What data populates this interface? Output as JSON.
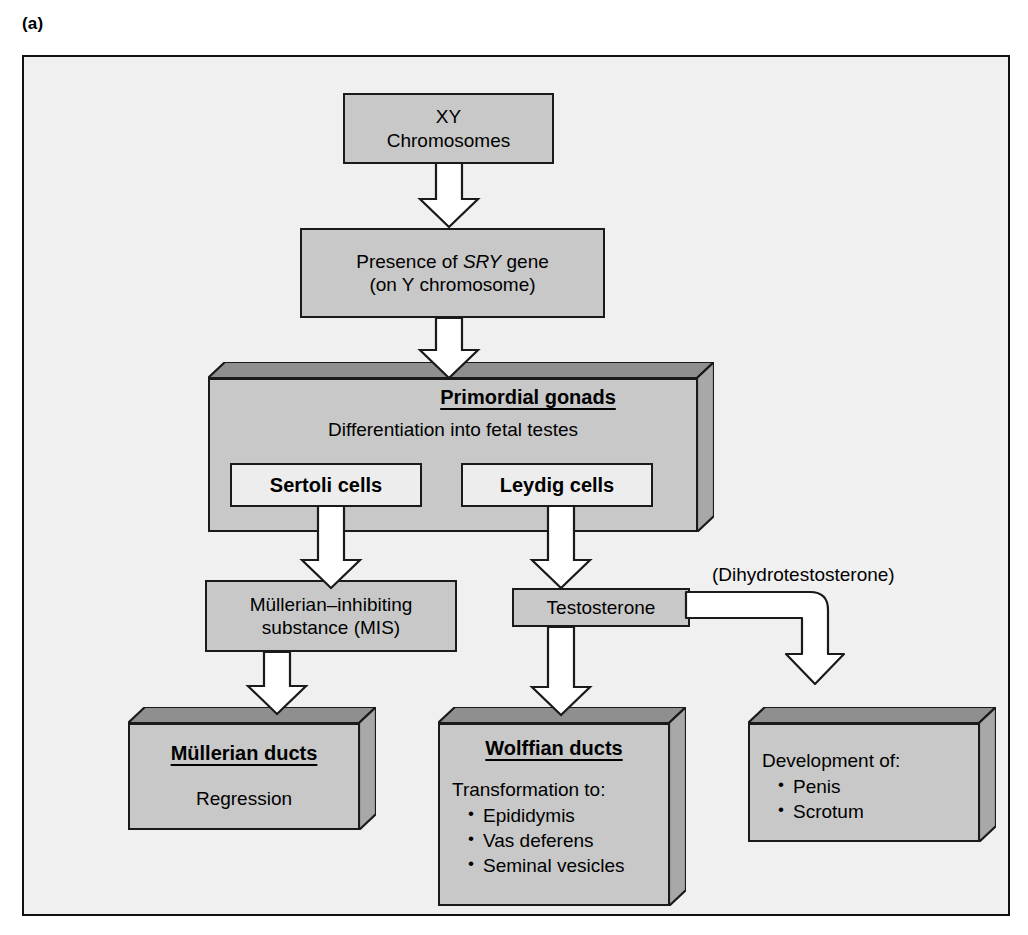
{
  "figure": {
    "panel_label": "(a)",
    "background_color": "#f0f0f0",
    "box_fill": "#c8c8c8",
    "box_fill_light": "#ededed",
    "outline_color": "#1a1a1a",
    "arrow_fill": "#ffffff"
  },
  "nodes": {
    "xy_chromosomes": {
      "line1": "XY",
      "line2": "Chromosomes"
    },
    "sry": {
      "prefix": "Presence of ",
      "gene": "SRY",
      "suffix": " gene",
      "line2": "(on Y chromosome)"
    },
    "gonads": {
      "title": "Primordial gonads",
      "subtitle": "Differentiation into fetal testes",
      "sertoli": "Sertoli cells",
      "leydig": "Leydig cells"
    },
    "mis": {
      "line1": "Müllerian–inhibiting",
      "line2": "substance (MIS)"
    },
    "testosterone": {
      "label": "Testosterone"
    },
    "dht": {
      "label": "(Dihydrotestosterone)"
    },
    "mullerian_ducts": {
      "title": "Müllerian ducts",
      "body": "Regression"
    },
    "wolffian_ducts": {
      "title": "Wolffian ducts",
      "body": "Transformation to:",
      "items": [
        "Epididymis",
        "Vas deferens",
        "Seminal vesicles"
      ]
    },
    "external_genitalia": {
      "body": "Development of:",
      "items": [
        "Penis",
        "Scrotum"
      ]
    }
  },
  "arrows": [
    {
      "name": "xy-to-sry",
      "from": "xy_chromosomes",
      "to": "sry",
      "style": "block-down"
    },
    {
      "name": "sry-to-gonads",
      "from": "sry",
      "to": "gonads",
      "style": "block-down"
    },
    {
      "name": "sertoli-to-mis",
      "from": "sertoli",
      "to": "mis",
      "style": "block-down"
    },
    {
      "name": "leydig-to-testosterone",
      "from": "leydig",
      "to": "testosterone",
      "style": "block-down"
    },
    {
      "name": "mis-to-mullerian",
      "from": "mis",
      "to": "mullerian_ducts",
      "style": "block-down"
    },
    {
      "name": "testosterone-to-wolffian",
      "from": "testosterone",
      "to": "wolffian_ducts",
      "style": "block-down"
    },
    {
      "name": "testosterone-to-genitalia",
      "from": "testosterone",
      "to": "external_genitalia",
      "style": "elbow-right-down"
    }
  ]
}
